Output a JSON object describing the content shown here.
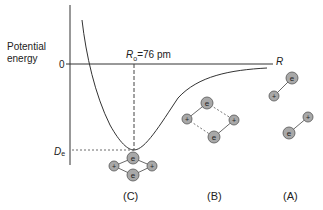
{
  "diagram": {
    "type": "potential-energy-curve",
    "y_axis_label": "Potential energy",
    "x_axis_label": "R",
    "zero_tick_label": "0",
    "well_depth_label": {
      "main": "D",
      "sub": "e"
    },
    "equilibrium_label": {
      "symbol": "R",
      "sub": "o",
      "value_text": "=76 pm"
    },
    "equilibrium_distance_pm": 76,
    "stages": [
      {
        "id": "C",
        "label": "(C)",
        "description": "bonded H2 molecule at equilibrium distance"
      },
      {
        "id": "B",
        "label": "(B)",
        "description": "two approaching H atoms interacting"
      },
      {
        "id": "A",
        "label": "(A)",
        "description": "two separated H atoms"
      }
    ],
    "particle_labels": {
      "nucleus": "+",
      "electron": "e"
    },
    "colors": {
      "line": "#333333",
      "particle_fill": "#a8a8a8",
      "particle_stroke": "#555555"
    }
  }
}
